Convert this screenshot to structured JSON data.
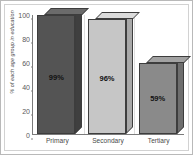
{
  "chart_data": {
    "type": "bar",
    "title": "",
    "subtitle": "",
    "xlabel": "",
    "ylabel": "% of each age group in education",
    "categories": [
      "Primary",
      "Secondary",
      "Tertiary"
    ],
    "values": [
      99,
      96,
      59
    ],
    "data_labels": [
      "99%",
      "96%",
      "59%"
    ],
    "ylim": [
      0,
      100
    ],
    "ytick_labels": [
      "100",
      "80",
      "60",
      "40",
      "20",
      "0"
    ],
    "ytick_values": [
      100,
      80,
      60,
      40,
      20,
      0
    ],
    "grid": "vertical-separators",
    "legend": "none",
    "series": [
      {
        "name": "% of each age group in education",
        "values": [
          99,
          96,
          59
        ]
      }
    ],
    "bar_colors": [
      "#545454",
      "#c6c6c6",
      "#8a8a8a"
    ],
    "bar_top_colors": [
      "#6b6b6b",
      "#dcdcdc",
      "#a2a2a2"
    ],
    "bar_side_colors": [
      "#3f3f3f",
      "#a8a8a8",
      "#6e6e6e"
    ],
    "style": "3d-bar",
    "axis_color": "#7b7b7b",
    "gridline_color": "#dedede",
    "text_color": "#4a4a4a",
    "background": "#ffffff",
    "border_color": "#b9b9b9"
  }
}
